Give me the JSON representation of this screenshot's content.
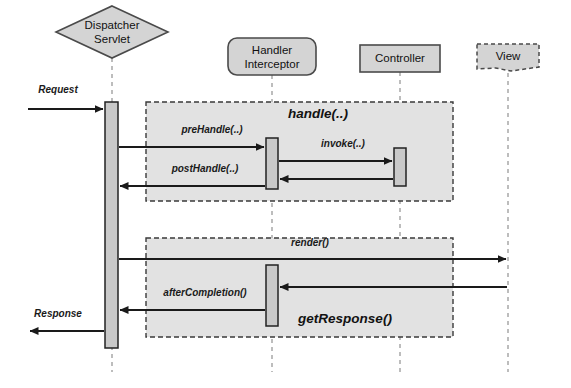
{
  "diagram": {
    "type": "uml-sequence-diagram",
    "canvas": {
      "width": 571,
      "height": 388,
      "background": "#ffffff"
    },
    "colors": {
      "node_fill": "#d4d4d4",
      "node_stroke": "#4a4a4a",
      "fragment_fill": "#e2e2e2",
      "fragment_stroke": "#3a3a3a",
      "activation_fill": "#c9c9c9",
      "activation_stroke": "#222222",
      "lifeline_stroke": "#9a9a9a",
      "arrow_stroke": "#1a1a1a",
      "text": "#111111"
    }
  },
  "participants": [
    {
      "id": "dispatcher-servlet",
      "label_line1": "Dispatcher",
      "label_line2": "Servlet",
      "shape": "diamond",
      "cx": 112,
      "cy": 32,
      "rx": 56,
      "ry": 26,
      "lifeline_x": 112,
      "lifeline_top": 58,
      "lifeline_bottom": 372
    },
    {
      "id": "handler-interceptor",
      "label_line1": "Handler",
      "label_line2": "Interceptor",
      "shape": "rounded-rect",
      "x": 228,
      "y": 38,
      "w": 88,
      "h": 37,
      "lifeline_x": 272,
      "lifeline_top": 75,
      "lifeline_bottom": 372
    },
    {
      "id": "controller",
      "label_line1": "Controller",
      "label_line2": "",
      "shape": "rect",
      "x": 360,
      "y": 45,
      "w": 80,
      "h": 27,
      "lifeline_x": 400,
      "lifeline_top": 72,
      "lifeline_bottom": 372
    },
    {
      "id": "view",
      "label_line1": "View",
      "label_line2": "",
      "shape": "dashed-note",
      "x": 477,
      "y": 44,
      "w": 62,
      "h": 27,
      "lifeline_x": 508,
      "lifeline_top": 73,
      "lifeline_bottom": 372
    }
  ],
  "fragments": [
    {
      "id": "handle-fragment",
      "label": "handle(..)",
      "label_x": 318,
      "label_y": 118,
      "x": 146,
      "y": 102,
      "w": 307,
      "h": 99
    },
    {
      "id": "get-response-fragment",
      "label": "getResponse()",
      "label_x": 345,
      "label_y": 323,
      "x": 146,
      "y": 238,
      "w": 307,
      "h": 99
    }
  ],
  "activations": [
    {
      "id": "activation-dispatcher",
      "x": 105,
      "y": 102,
      "w": 13,
      "h": 246
    },
    {
      "id": "activation-interceptor-handle",
      "x": 266,
      "y": 138,
      "w": 12,
      "h": 51
    },
    {
      "id": "activation-controller-invoke",
      "x": 394,
      "y": 148,
      "w": 12,
      "h": 38
    },
    {
      "id": "activation-interceptor-after",
      "x": 266,
      "y": 265,
      "w": 12,
      "h": 61
    }
  ],
  "messages": [
    {
      "id": "message-request",
      "label": "Request",
      "label_x": 58,
      "label_y": 93,
      "label_align": "middle",
      "x1": 28,
      "x2": 103,
      "y": 109,
      "direction": "right",
      "style": "solid"
    },
    {
      "id": "message-prehandle",
      "label": "preHandle(..)",
      "label_x": 212,
      "label_y": 133,
      "label_align": "middle",
      "x1": 119,
      "x2": 264,
      "y": 147,
      "direction": "right",
      "style": "solid"
    },
    {
      "id": "message-invoke",
      "label": "invoke(..)",
      "label_x": 343,
      "label_y": 147,
      "label_align": "middle",
      "x1": 279,
      "x2": 392,
      "y": 161,
      "direction": "right",
      "style": "solid"
    },
    {
      "id": "message-invoke-return",
      "label": "",
      "label_x": 0,
      "label_y": 0,
      "label_align": "middle",
      "x1": 393,
      "x2": 280,
      "y": 179,
      "direction": "left",
      "style": "solid"
    },
    {
      "id": "message-posthandle",
      "label": "postHandle(..)",
      "label_x": 205,
      "label_y": 172,
      "label_align": "middle",
      "x1": 265,
      "x2": 120,
      "y": 186,
      "direction": "left",
      "style": "solid"
    },
    {
      "id": "message-render",
      "label": "render()",
      "label_x": 310,
      "label_y": 246,
      "label_align": "middle",
      "x1": 119,
      "x2": 506,
      "y": 259,
      "direction": "right",
      "style": "solid"
    },
    {
      "id": "message-render-return",
      "label": "",
      "label_x": 0,
      "label_y": 0,
      "label_align": "middle",
      "x1": 507,
      "x2": 280,
      "y": 287,
      "direction": "left",
      "style": "solid"
    },
    {
      "id": "message-aftercompletion",
      "label": "afterCompletion()",
      "label_x": 205,
      "label_y": 296,
      "label_align": "middle",
      "x1": 265,
      "x2": 120,
      "y": 310,
      "direction": "left",
      "style": "solid"
    },
    {
      "id": "message-response",
      "label": "Response",
      "label_x": 58,
      "label_y": 317,
      "label_align": "middle",
      "x1": 104,
      "x2": 30,
      "y": 331,
      "direction": "left",
      "style": "solid"
    }
  ]
}
